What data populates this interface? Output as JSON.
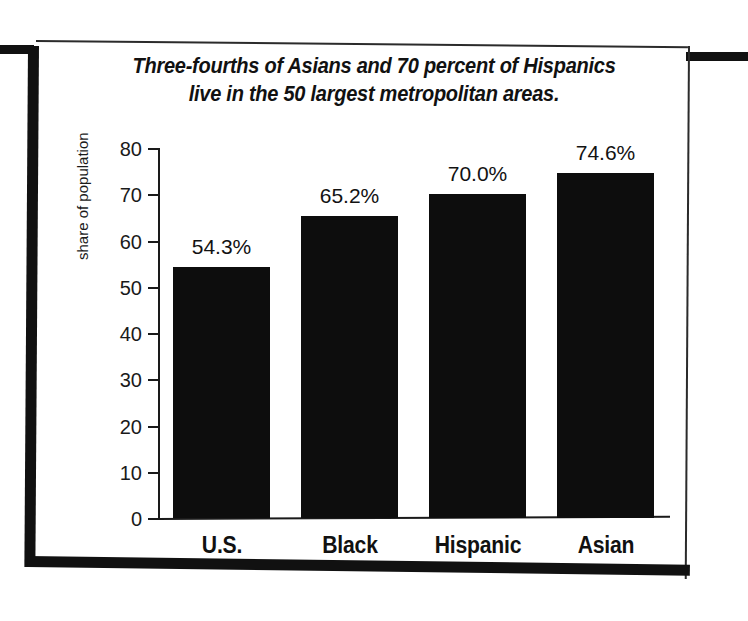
{
  "chart_data": {
    "type": "bar",
    "title": "Three-fourths of Asians and 70 percent of Hispanics live in the 50 largest metropolitan areas.",
    "title_line1": "Three-fourths of Asians and 70 percent of Hispanics",
    "title_line2": "live in the 50 largest metropolitan areas.",
    "categories": [
      "U.S.",
      "Black",
      "Hispanic",
      "Asian"
    ],
    "values": [
      54.3,
      65.2,
      70.0,
      74.6
    ],
    "value_labels": [
      "54.3%",
      "65.2%",
      "70.0%",
      "74.6%"
    ],
    "xlabel": "",
    "ylabel": "share of population",
    "ylim": [
      0,
      80
    ],
    "ytick_labels": [
      "80",
      "70",
      "60",
      "50",
      "40",
      "30",
      "20",
      "10",
      "0"
    ],
    "ytick_values": [
      80,
      70,
      60,
      50,
      40,
      30,
      20,
      10,
      0
    ],
    "grid": false,
    "legend": null,
    "bar_color": "#0d0d0d",
    "axis_color": "#1a1a1a",
    "background_color": "#ffffff"
  }
}
